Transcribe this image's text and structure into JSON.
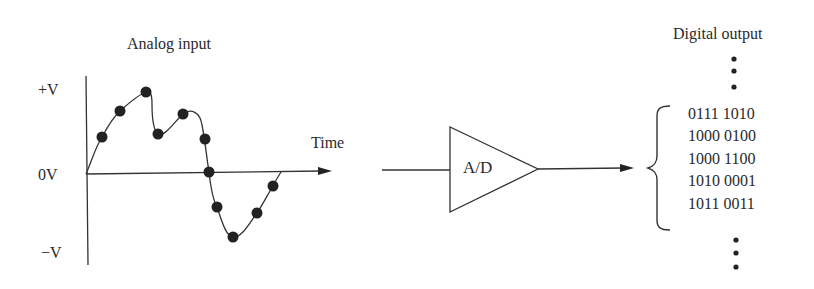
{
  "analog": {
    "title": "Analog input",
    "y_labels": {
      "pos": "+V",
      "zero": "0V",
      "neg": "−V"
    },
    "x_label": "Time",
    "sample_points": [
      {
        "x": 102,
        "y": 137
      },
      {
        "x": 120,
        "y": 111
      },
      {
        "x": 146,
        "y": 92
      },
      {
        "x": 158,
        "y": 134
      },
      {
        "x": 183,
        "y": 114
      },
      {
        "x": 205,
        "y": 139
      },
      {
        "x": 209,
        "y": 172
      },
      {
        "x": 217,
        "y": 207
      },
      {
        "x": 233,
        "y": 237
      },
      {
        "x": 257,
        "y": 213
      },
      {
        "x": 273,
        "y": 186
      }
    ]
  },
  "converter": {
    "label": "A/D"
  },
  "digital": {
    "title": "Digital output",
    "codes": [
      "0111 1010",
      "1000 0100",
      "1000 1100",
      "1010 0001",
      "1011 0011"
    ],
    "ellipsis_top": "⋮",
    "ellipsis_bottom": "⋮"
  },
  "colors": {
    "ink": "#2a2a2a",
    "dot": "#222222",
    "background": "#ffffff"
  }
}
